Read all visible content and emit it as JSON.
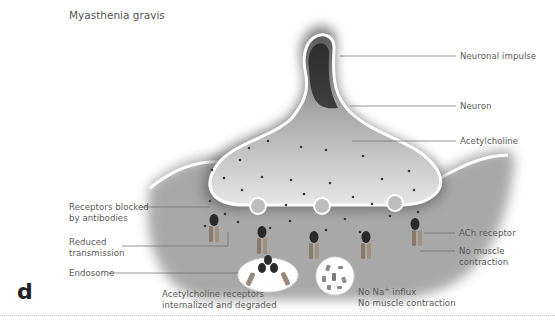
{
  "figure": {
    "title": "Myasthenia gravis",
    "panel_letter": "d",
    "colors": {
      "background": "#ffffff",
      "neuron_dark": "#2e2e2e",
      "membrane": "#ffffff",
      "label_text": "#5a5a5a",
      "leader_line": "#6a6a6a"
    }
  },
  "labels": {
    "neuronal_impulse": "Neuronal impulse",
    "neuron": "Neuron",
    "acetylcholine": "Acetylcholine",
    "receptors_blocked_line1": "Receptors blocked",
    "receptors_blocked_line2": "by antibodies",
    "reduced_transmission_line1": "Reduced",
    "reduced_transmission_line2": "transmission",
    "endosome": "Endosome",
    "ach_receptor": "ACh receptor",
    "no_muscle_contraction_line1": "No muscle",
    "no_muscle_contraction_line2": "contraction",
    "internalized_line1": "Acetylcholine receptors",
    "internalized_line2": "internalized and degraded",
    "no_na_influx_prefix": "No Na",
    "no_na_influx_sup": "+",
    "no_na_influx_suffix": " influx",
    "no_muscle_contraction_2": "No muscle contraction"
  }
}
